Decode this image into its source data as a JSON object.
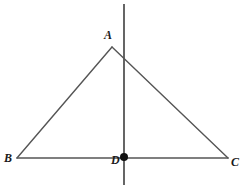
{
  "figure": {
    "background_color": "#ffffff",
    "line_color": "#555555",
    "point_color": "#111111",
    "label_color": "#1a1a1a",
    "width": 245,
    "height": 190
  },
  "labels": {
    "A": "A",
    "B": "B",
    "C": "C",
    "D": "D"
  },
  "points": {
    "A": {
      "x": 112,
      "y": 47
    },
    "B": {
      "x": 17,
      "y": 158
    },
    "C": {
      "x": 228,
      "y": 158
    },
    "D": {
      "x": 124,
      "y": 157
    }
  },
  "segments": [
    {
      "name": "side-AB",
      "from": "B",
      "to": "A"
    },
    {
      "name": "side-AC",
      "from": "A",
      "to": "C"
    },
    {
      "name": "side-BC",
      "from": "B",
      "to": "C"
    }
  ],
  "vertical_line": {
    "name": "vertical-line-through-D",
    "x": 124,
    "y_top": 4,
    "y_bottom": 185
  },
  "marked_point": {
    "name": "point-D",
    "x": 124,
    "y": 157,
    "radius": 4
  }
}
